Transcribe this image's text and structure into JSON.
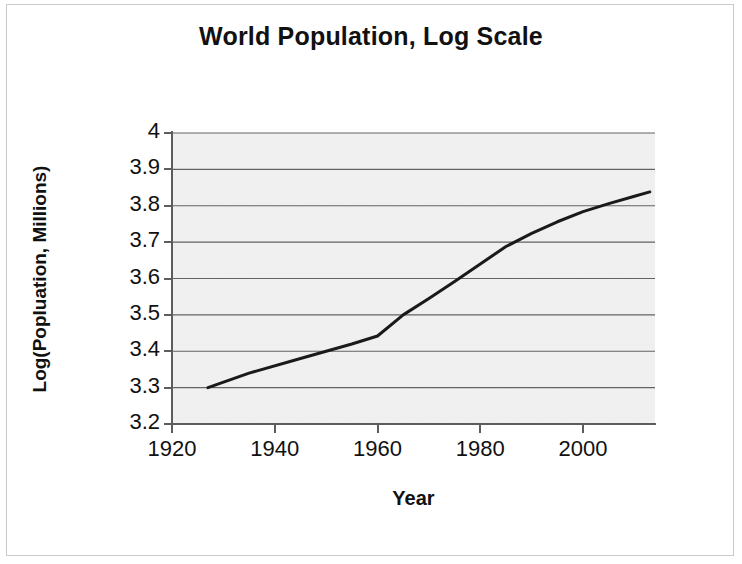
{
  "figure": {
    "title": "World Population, Log Scale"
  },
  "chart_data": {
    "type": "line",
    "title": "World Population, Log Scale",
    "xlabel": "Year",
    "ylabel": "Log(Popluation, Millions)",
    "xlim": [
      1920,
      2014
    ],
    "ylim": [
      3.2,
      4.0
    ],
    "xticks": [
      1920,
      1940,
      1960,
      1980,
      2000
    ],
    "xtick_labels": [
      "1920",
      "1940",
      "1960",
      "1980",
      "2000"
    ],
    "yticks": [
      3.2,
      3.3,
      3.4,
      3.5,
      3.6,
      3.7,
      3.8,
      3.9,
      4.0
    ],
    "ytick_labels": [
      "3.2",
      "3.3",
      "3.4",
      "3.5",
      "3.6",
      "3.7",
      "3.8",
      "3.9",
      "4"
    ],
    "grid": "horizontal",
    "legend": "none",
    "plot_background": "#e9e9e9",
    "line_color": "#1a1a1a",
    "line_width": 3,
    "series": [
      {
        "name": "World Population (log10, millions)",
        "x": [
          1927,
          1935,
          1945,
          1955,
          1960,
          1965,
          1970,
          1975,
          1980,
          1985,
          1990,
          1995,
          2000,
          2005,
          2010,
          2013
        ],
        "y": [
          3.3,
          3.34,
          3.38,
          3.42,
          3.442,
          3.5,
          3.545,
          3.592,
          3.64,
          3.688,
          3.724,
          3.756,
          3.784,
          3.806,
          3.826,
          3.838
        ]
      }
    ]
  }
}
